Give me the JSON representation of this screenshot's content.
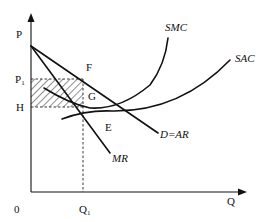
{
  "diagram": {
    "type": "monopoly-short-run-equilibrium",
    "axes": {
      "y_label": "P",
      "x_label": "Q",
      "origin_label": "0"
    },
    "price_labels": {
      "p1": "P",
      "p1_sub": "1",
      "h": "H"
    },
    "quantity_labels": {
      "q1": "Q",
      "q1_sub": "1"
    },
    "curves": {
      "smc": "SMC",
      "sac": "SAC",
      "demand": "D=AR",
      "mr": "MR"
    },
    "points": {
      "f": "F",
      "g": "G",
      "e": "E"
    },
    "shaded_region": "profit rectangle P1-F-G-H",
    "colors": {
      "line": "#111111",
      "background": "#ffffff"
    }
  }
}
